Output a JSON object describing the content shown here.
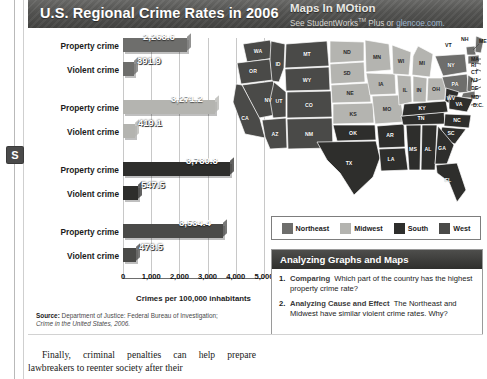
{
  "feature": {
    "title": "U.S. Regional Crime Rates in 2006",
    "maps_in_motion": {
      "title": "Maps In MOtion",
      "subtitle_pre": "See StudentWorks",
      "trademark": "TM",
      "subtitle_mid": " Plus or ",
      "link": "glencoe.com."
    }
  },
  "chart_data": {
    "type": "bar",
    "title": "U.S. Regional Crime Rates in 2006",
    "xlabel": "Crimes per 100,000 inhabitants",
    "ylabel": "",
    "xlim": [
      0,
      5000
    ],
    "xticks": [
      "0",
      "1,000",
      "2,000",
      "3,000",
      "4,000",
      "5,000"
    ],
    "grid": true,
    "legend_position": "below-map",
    "groups": [
      {
        "region": "Northeast",
        "color": "#6e6e6c",
        "bars": [
          {
            "label": "Property crime",
            "value": 2268.6,
            "value_text": "2,268.6"
          },
          {
            "label": "Violent crime",
            "value": 391.9,
            "value_text": "391.9"
          }
        ]
      },
      {
        "region": "Midwest",
        "color": "#b4b4b0",
        "bars": [
          {
            "label": "Property crime",
            "value": 3271.2,
            "value_text": "3,271.2"
          },
          {
            "label": "Violent crime",
            "value": 419.1,
            "value_text": "419.1"
          }
        ]
      },
      {
        "region": "South",
        "color": "#2e2e2c",
        "bars": [
          {
            "label": "Property crime",
            "value": 3780.8,
            "value_text": "3,780.8"
          },
          {
            "label": "Violent crime",
            "value": 547.5,
            "value_text": "547.5"
          }
        ]
      },
      {
        "region": "West",
        "color": "#4a4a48",
        "bars": [
          {
            "label": "Property crime",
            "value": 3534.4,
            "value_text": "3,534.4"
          },
          {
            "label": "Violent crime",
            "value": 473.5,
            "value_text": "473.5"
          }
        ]
      }
    ],
    "source": {
      "label": "Source:",
      "text": " Department of Justice: Federal Bureau of Investigation;",
      "italic": "Crime in the United States, 2006."
    }
  },
  "map": {
    "legend": [
      {
        "name": "Northeast",
        "color": "#6e6e6c"
      },
      {
        "name": "Midwest",
        "color": "#b4b4b0"
      },
      {
        "name": "South",
        "color": "#2e2e2c"
      },
      {
        "name": "West",
        "color": "#4a4a48"
      }
    ],
    "inset_labels": [
      "NH",
      "MA",
      "RI",
      "CT",
      "NJ",
      "DE",
      "MD",
      "D.C.",
      "ME",
      "VT"
    ]
  },
  "analyze": {
    "heading": "Analyzing Graphs and Maps",
    "questions": [
      {
        "num": "1.",
        "term": "Comparing",
        "text": "Which part of the country has the highest property crime rate?"
      },
      {
        "num": "2.",
        "term": "Analyzing Cause and Effect",
        "text": "The Northeast and Midwest have similar violent crime rates. Why?"
      }
    ]
  },
  "margin": {
    "section_marker": "S"
  },
  "body_text": {
    "paragraph": "Finally, criminal penalties can help prepare lawbreakers to reenter society after their"
  }
}
